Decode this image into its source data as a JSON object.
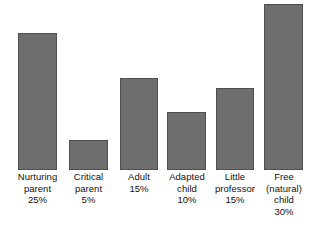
{
  "chart_data": {
    "type": "bar",
    "title": "",
    "subtitle": "",
    "xlabel": "",
    "ylabel": "",
    "grid": false,
    "legend": "none",
    "axis_visible": false,
    "baseline_y_px": 170,
    "categories": [
      "Nurturing parent",
      "Critical parent",
      "Adult",
      "Adapted child",
      "Little professor",
      "Free (natural) child"
    ],
    "values": [
      25,
      5,
      15,
      10,
      15,
      30
    ],
    "value_unit": "%",
    "ylim": [
      0,
      30
    ],
    "bars": [
      {
        "category": "Nurturing parent",
        "value": 25,
        "value_label": "25%",
        "label_lines": "Nurturing\nparent\n25%",
        "x_px": 18,
        "width_px": 39,
        "top_px": 33,
        "height_px": 137,
        "label_left_px": 6,
        "label_width_px": 63
      },
      {
        "category": "Critical parent",
        "value": 5,
        "value_label": "5%",
        "label_lines": "Critical\nparent\n5%",
        "x_px": 69,
        "width_px": 39,
        "top_px": 140,
        "height_px": 30,
        "label_left_px": 57,
        "label_width_px": 63
      },
      {
        "category": "Adult",
        "value": 15,
        "value_label": "15%",
        "label_lines": "Adult\n15%",
        "x_px": 120,
        "width_px": 38,
        "top_px": 78,
        "height_px": 92,
        "label_left_px": 108,
        "label_width_px": 62
      },
      {
        "category": "Adapted child",
        "value": 10,
        "value_label": "10%",
        "label_lines": "Adapted\nchild\n10%",
        "x_px": 167,
        "width_px": 39,
        "top_px": 112,
        "height_px": 58,
        "label_left_px": 156,
        "label_width_px": 62
      },
      {
        "category": "Little professor",
        "value": 15,
        "value_label": "15%",
        "label_lines": "Little\nprofessor\n15%",
        "x_px": 216,
        "width_px": 38,
        "top_px": 88,
        "height_px": 82,
        "label_left_px": 204,
        "label_width_px": 62
      },
      {
        "category": "Free (natural) child",
        "value": 30,
        "value_label": "30%",
        "label_lines": "Free\n(natural)\nchild\n30%",
        "x_px": 264,
        "width_px": 39,
        "top_px": 4,
        "height_px": 166,
        "label_left_px": 253,
        "label_width_px": 62
      }
    ],
    "colors": {
      "bar_fill": "#6e6e6e",
      "bar_stroke": "#4f4f4f",
      "background": "#ffffff",
      "label_text": "#111111"
    }
  }
}
